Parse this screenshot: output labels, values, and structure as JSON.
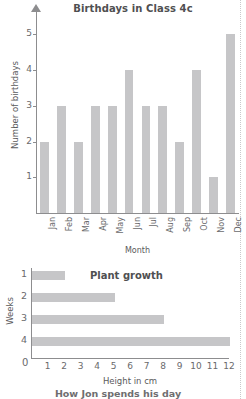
{
  "page": {
    "next_section_caption": "How Jon spends his day"
  },
  "style": {
    "bar_color": "#c6c6c8",
    "axis_color": "#8d8d8f",
    "text_color": "#5a5a5c",
    "margin_guide_color": "#c9c9cb"
  },
  "chart_data": [
    {
      "type": "bar",
      "orientation": "vertical",
      "title": "Birthdays in Class 4c",
      "xlabel": "Month",
      "ylabel": "Number of birthdays",
      "categories": [
        "Jan",
        "Feb",
        "Mar",
        "Apr",
        "May",
        "Jun",
        "Jul",
        "Aug",
        "Sep",
        "Oct",
        "Nov",
        "Dec"
      ],
      "values": [
        2,
        3,
        2,
        3,
        3,
        4,
        3,
        3,
        2,
        4,
        1,
        5
      ],
      "yticks": [
        1,
        2,
        3,
        4,
        5
      ],
      "ylim": [
        0,
        5.6
      ],
      "grid": false,
      "legend": false,
      "axis_arrow": true
    },
    {
      "type": "bar",
      "orientation": "horizontal",
      "title": "Plant growth",
      "xlabel": "Height in cm",
      "ylabel": "Weeks",
      "categories": [
        "1",
        "2",
        "3",
        "4"
      ],
      "values": [
        2,
        5,
        8,
        12
      ],
      "xticks": [
        0,
        1,
        2,
        3,
        4,
        5,
        6,
        7,
        8,
        9,
        10,
        11,
        12
      ],
      "xlim": [
        0,
        12
      ],
      "grid": false,
      "legend": false,
      "axis_arrow": false
    }
  ]
}
